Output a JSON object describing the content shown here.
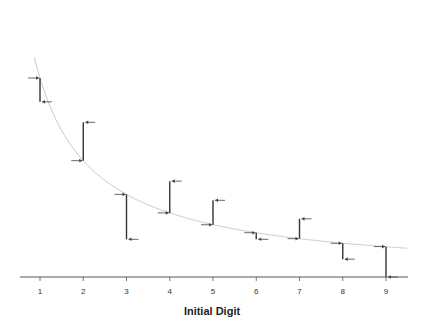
{
  "chart_data": {
    "type": "line",
    "title": "",
    "xlabel": "Initial Digit",
    "ylabel": "",
    "categories": [
      "1",
      "2",
      "3",
      "4",
      "5",
      "6",
      "7",
      "8",
      "9"
    ],
    "x": [
      1,
      2,
      3,
      4,
      5,
      6,
      7,
      8,
      9
    ],
    "series": [
      {
        "name": "Expected (Benford curve)",
        "style": "smooth light gray curve",
        "values": [
          0.301,
          0.176,
          0.125,
          0.097,
          0.079,
          0.067,
          0.058,
          0.051,
          0.046
        ]
      },
      {
        "name": "Observed",
        "style": "vertical dark segments from expected to observed with arrows",
        "values": [
          0.265,
          0.234,
          0.057,
          0.145,
          0.116,
          0.057,
          0.088,
          0.027,
          0.0
        ]
      }
    ],
    "xlim": [
      0.5,
      9.5
    ],
    "ylim": [
      0,
      0.4
    ],
    "grid": false,
    "legend": "none",
    "axes": {
      "x_axis_visible": true,
      "y_axis_visible": false
    }
  },
  "colors": {
    "curve": "#c8c8c8",
    "segment": "#333333",
    "arrow": "#444444",
    "axis": "#555555"
  }
}
